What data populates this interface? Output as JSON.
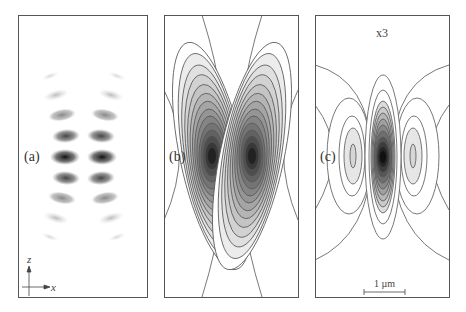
{
  "figure": {
    "panels": [
      {
        "id": "a",
        "label": "(a)",
        "type": "intensity-density"
      },
      {
        "id": "b",
        "label": "(b)",
        "type": "contour"
      },
      {
        "id": "c",
        "label": "(c)",
        "type": "contour",
        "annotation": "x3",
        "scale_bar": "1 µm"
      }
    ],
    "axes": {
      "vertical": "z",
      "horizontal": "x"
    },
    "colors": {
      "border": "#555555",
      "contour": "#555555",
      "dark": "#111111"
    }
  }
}
